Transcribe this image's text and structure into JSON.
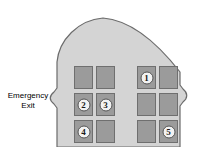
{
  "diagram": {
    "background_color": "#ffffff",
    "cabin_fill_color": "#d4d4d4",
    "cabin_stroke_color": "#6b6b6b",
    "seat_fill_color": "#9b9b9b",
    "seat_stroke_color": "#6f6f6f",
    "marker_fill_color": "#f2f2f2",
    "marker_text_color": "#1a1a1a"
  },
  "labels": {
    "emergency_exit_line1": "Emergency",
    "emergency_exit_line2": "Exit"
  },
  "seats": {
    "left_block": [
      {
        "id": "left-r1-c1",
        "row": 1,
        "col": 1,
        "x": 74,
        "y": 66,
        "marker": ""
      },
      {
        "id": "left-r1-c2",
        "row": 1,
        "col": 2,
        "x": 96,
        "y": 66,
        "marker": ""
      },
      {
        "id": "left-r2-c1",
        "row": 2,
        "col": 1,
        "x": 74,
        "y": 93,
        "marker": "2"
      },
      {
        "id": "left-r2-c2",
        "row": 2,
        "col": 2,
        "x": 96,
        "y": 93,
        "marker": "3"
      },
      {
        "id": "left-r3-c1",
        "row": 3,
        "col": 1,
        "x": 74,
        "y": 120,
        "marker": "4"
      },
      {
        "id": "left-r3-c2",
        "row": 3,
        "col": 2,
        "x": 96,
        "y": 120,
        "marker": ""
      }
    ],
    "right_block": [
      {
        "id": "right-r1-c1",
        "row": 1,
        "col": 1,
        "x": 137,
        "y": 66,
        "marker": "1"
      },
      {
        "id": "right-r1-c2",
        "row": 1,
        "col": 2,
        "x": 159,
        "y": 66,
        "marker": ""
      },
      {
        "id": "right-r2-c1",
        "row": 2,
        "col": 1,
        "x": 137,
        "y": 93,
        "marker": ""
      },
      {
        "id": "right-r2-c2",
        "row": 2,
        "col": 2,
        "x": 159,
        "y": 93,
        "marker": ""
      },
      {
        "id": "right-r3-c1",
        "row": 3,
        "col": 1,
        "x": 137,
        "y": 120,
        "marker": ""
      },
      {
        "id": "right-r3-c2",
        "row": 3,
        "col": 2,
        "x": 159,
        "y": 120,
        "marker": "5"
      }
    ]
  },
  "markers": {
    "m1": "1",
    "m2": "2",
    "m3": "3",
    "m4": "4",
    "m5": "5"
  }
}
